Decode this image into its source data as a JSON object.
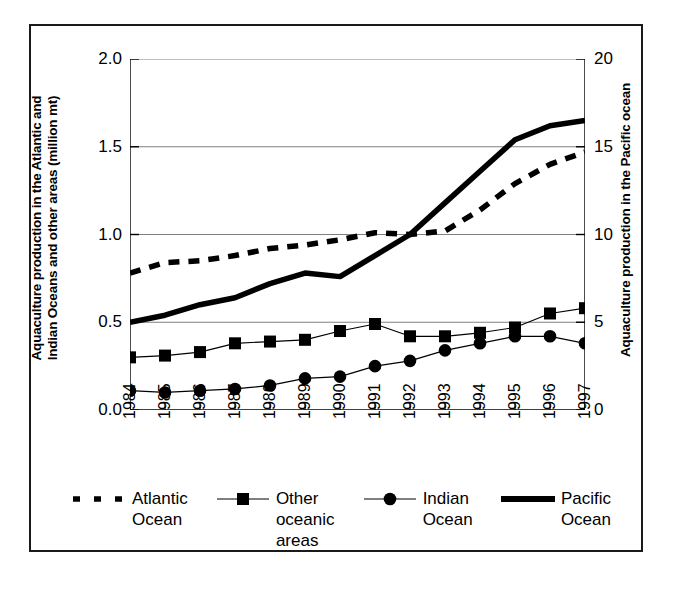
{
  "figure": {
    "background": "#ffffff",
    "frame_color": "#1a1a1a",
    "axis_color": "#000000",
    "gridline_color": "#808080"
  },
  "axes": {
    "y_left": {
      "title_line1": "Aquaculture production in the Atlantic and",
      "title_line2": "Indian Oceans and other areas (million mt)",
      "ticks": [
        "0.0",
        "0.5",
        "1.0",
        "1.5",
        "2.0"
      ],
      "min": 0.0,
      "max": 2.0
    },
    "y_right": {
      "title": "Aquaculture production in the Pacific ocean",
      "ticks": [
        "0",
        "5",
        "10",
        "15",
        "20"
      ],
      "min": 0,
      "max": 20
    },
    "x": {
      "ticks": [
        "1984",
        "1985",
        "1986",
        "1987",
        "1988",
        "1989",
        "1990",
        "1991",
        "1992",
        "1993",
        "1994",
        "1995",
        "1996",
        "1997"
      ]
    }
  },
  "legend": {
    "entries": [
      {
        "label": "Atlantic\nOcean",
        "style": "dashed-thick",
        "marker": "none",
        "icon": "dashed-line-icon"
      },
      {
        "label": "Other\noceanic\nareas",
        "style": "thin-with-marker",
        "marker": "square",
        "icon": "square-marker-line-icon"
      },
      {
        "label": "Indian\nOcean",
        "style": "thin-with-marker",
        "marker": "circle",
        "icon": "circle-marker-line-icon"
      },
      {
        "label": "Pacific\nOcean",
        "style": "solid-thick",
        "marker": "none",
        "icon": "solid-line-icon"
      }
    ]
  },
  "chart_data": {
    "type": "line",
    "title": "",
    "subtitle": "",
    "xlabel": "",
    "ylabel": "Aquaculture production in the Atlantic and Indian Oceans and other areas (million mt)",
    "ylabel_right": "Aquaculture production in the Pacific ocean",
    "x": [
      1984,
      1985,
      1986,
      1987,
      1988,
      1989,
      1990,
      1991,
      1992,
      1993,
      1994,
      1995,
      1996,
      1997
    ],
    "ylim": [
      0.0,
      2.0
    ],
    "ylim_right": [
      0,
      20
    ],
    "grid": true,
    "grid_axis": "y",
    "legend_position": "bottom",
    "series": [
      {
        "name": "Atlantic Ocean",
        "axis": "left",
        "style": "dashed",
        "marker": "none",
        "values": [
          0.78,
          0.84,
          0.85,
          0.88,
          0.92,
          0.94,
          0.97,
          1.01,
          1.0,
          1.02,
          1.14,
          1.29,
          1.4,
          1.47
        ]
      },
      {
        "name": "Other oceanic areas",
        "axis": "left",
        "style": "solid-thin",
        "marker": "square",
        "values": [
          0.3,
          0.31,
          0.33,
          0.38,
          0.39,
          0.4,
          0.45,
          0.49,
          0.42,
          0.42,
          0.44,
          0.47,
          0.55,
          0.58
        ]
      },
      {
        "name": "Indian Ocean",
        "axis": "left",
        "style": "solid-thin",
        "marker": "circle",
        "values": [
          0.11,
          0.1,
          0.11,
          0.12,
          0.14,
          0.18,
          0.19,
          0.25,
          0.28,
          0.34,
          0.38,
          0.42,
          0.42,
          0.38
        ]
      },
      {
        "name": "Pacific Ocean",
        "axis": "right",
        "style": "solid-thick",
        "marker": "none",
        "values": [
          5.0,
          5.4,
          6.0,
          6.4,
          7.2,
          7.8,
          7.6,
          8.8,
          10.0,
          11.8,
          13.6,
          15.4,
          16.2,
          16.5
        ]
      }
    ]
  }
}
